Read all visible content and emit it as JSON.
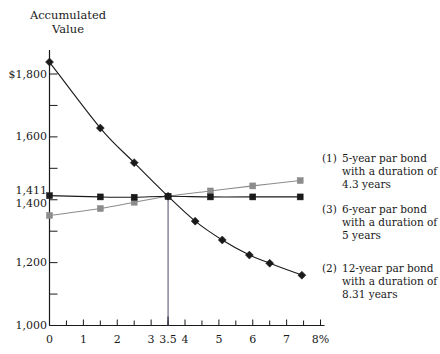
{
  "chart_data": {
    "type": "line",
    "title": "Accumulated\nValue",
    "xlabel": "",
    "ylabel": "",
    "xlim": [
      0,
      8
    ],
    "ylim": [
      1000,
      1900
    ],
    "grid": false,
    "legend_position": "right",
    "x_axis": {
      "unit_suffix": "%",
      "major_ticks": [
        0,
        1,
        2,
        3,
        4,
        5,
        6,
        7,
        8
      ],
      "minor_tick_step": 0.5,
      "tick_labels": [
        "0",
        "1",
        "2",
        "3",
        "3.5",
        "4",
        "5",
        "6",
        "7",
        "8%"
      ],
      "tick_label_values": [
        0,
        1,
        2,
        3,
        3.5,
        4,
        5,
        6,
        7,
        8
      ],
      "highlight_value": 3.5
    },
    "y_axis": {
      "major_ticks": [
        1000,
        1100,
        1200,
        1300,
        1400,
        1500,
        1600,
        1700,
        1800
      ],
      "tick_labels": [
        "$1,800",
        "1,600",
        "1,411",
        "1,400",
        "1,200",
        "1,000"
      ],
      "tick_label_values": [
        1800,
        1600,
        1411,
        1400,
        1200,
        1000
      ],
      "labelled_ticks": [
        1800,
        1600,
        1400,
        1200,
        1000
      ],
      "highlight_value": 1411
    },
    "crossing_point": {
      "x": 3.5,
      "y": 1411
    },
    "series": [
      {
        "name": "(1) 5-year par bond with a duration of 4.3 years",
        "key": "(1)",
        "marker": "square",
        "color": "#8c8c8c",
        "x": [
          0,
          1.5,
          2.5,
          3.5,
          4.75,
          6.0,
          7.4
        ],
        "values": [
          1350,
          1372,
          1392,
          1411,
          1428,
          1444,
          1461
        ]
      },
      {
        "name": "(3) 6-year par bond with a duration of 5 years",
        "key": "(3)",
        "marker": "square",
        "color": "#1a1a1a",
        "x": [
          0,
          1.5,
          2.5,
          3.5,
          4.75,
          6.0,
          7.4
        ],
        "values": [
          1413,
          1409,
          1408,
          1411,
          1409,
          1409,
          1409
        ]
      },
      {
        "name": "(2) 12-year par bond with a duration of 8.31 years",
        "key": "(2)",
        "marker": "diamond",
        "color": "#1a1a1a",
        "x": [
          0,
          1.5,
          2.5,
          3.5,
          4.3,
          5.1,
          5.9,
          6.5,
          7.45
        ],
        "values": [
          1838,
          1628,
          1518,
          1411,
          1332,
          1272,
          1224,
          1198,
          1160
        ]
      }
    ]
  },
  "legend": {
    "entries": [
      {
        "key": "(1)",
        "text": "5-year par bond\nwith a duration of\n4.3 years"
      },
      {
        "key": "(3)",
        "text": "6-year par bond\nwith a duration of\n5 years"
      },
      {
        "key": "(2)",
        "text": "12-year par bond\nwith a duration of\n8.31 years"
      }
    ]
  }
}
